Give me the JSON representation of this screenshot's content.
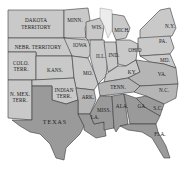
{
  "map": {
    "colors": {
      "light": "#c9c9c9",
      "dark": "#9a9a9a",
      "water": "#ececec",
      "border": "#3a3a3a",
      "background": "#ffffff"
    },
    "regions": {
      "dakota": {
        "label1": "DAKOTA",
        "label2": "TERRITORY"
      },
      "minn": {
        "label": "MINN."
      },
      "wis": {
        "label": "WIS."
      },
      "mich": {
        "label": "MICH."
      },
      "ny": {
        "label": "N.Y."
      },
      "nebr": {
        "label": "NEBR. TERRITORY"
      },
      "iowa": {
        "label": "IOWA"
      },
      "ill": {
        "label": "ILL."
      },
      "ind": {
        "label": "IND."
      },
      "ohio": {
        "label": "OHIO"
      },
      "pa": {
        "label": "PA."
      },
      "md": {
        "label": "MD."
      },
      "colo": {
        "label1": "COLO.",
        "label2": "TERR."
      },
      "kans": {
        "label": "KANS."
      },
      "mo": {
        "label": "MO."
      },
      "ky": {
        "label": "KY."
      },
      "va": {
        "label": "VA."
      },
      "nmex": {
        "label1": "N. MEX.",
        "label2": "TERR."
      },
      "indian": {
        "label1": "INDIAN",
        "label2": "TERR."
      },
      "ark": {
        "label": "ARK."
      },
      "tenn": {
        "label": "TENN."
      },
      "nc": {
        "label": "N.C."
      },
      "sc": {
        "label": "S.C."
      },
      "texas": {
        "label": "TEXAS"
      },
      "la": {
        "label": "LA."
      },
      "miss": {
        "label": "MISS."
      },
      "ala": {
        "label": "ALA."
      },
      "ga": {
        "label": "GA."
      },
      "fla": {
        "label": "FLA."
      }
    }
  }
}
